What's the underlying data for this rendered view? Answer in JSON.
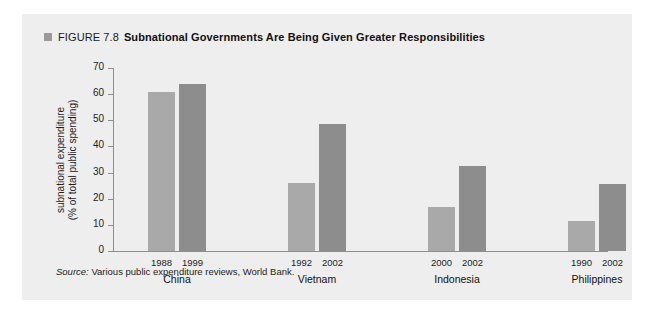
{
  "figure": {
    "bullet_icon": "square-bullet-icon",
    "number_label": "FIGURE 7.8",
    "title": "Subnational Governments Are Being Given Greater Responsibilities"
  },
  "source": {
    "label": "Source:",
    "text": " Various public expenditure reviews, World Bank."
  },
  "colors": {
    "panel_background": "#eeeeee",
    "bar_first": "#a9a9a9",
    "bar_second": "#8d8d8d",
    "axis": "#8e8e8e",
    "bullet": "#9a9a9a",
    "text": "#111111"
  },
  "chart_data": {
    "type": "bar",
    "title": "Subnational Governments Are Being Given Greater Responsibilities",
    "xlabel": "",
    "ylabel": "subnational expenditure (% of total public spending)",
    "ylabel_line1": "subnational expenditure",
    "ylabel_line2": "(% of total public spending)",
    "ylim": [
      0,
      70
    ],
    "ytick_labels": [
      "70",
      "60",
      "50",
      "40",
      "30",
      "20",
      "10",
      "0"
    ],
    "ytick_values": [
      70,
      60,
      50,
      40,
      30,
      20,
      10,
      0
    ],
    "grid": false,
    "legend": "none",
    "categories": [
      "China",
      "Vietnam",
      "Indonesia",
      "Philippines"
    ],
    "groups": [
      {
        "country": "China",
        "bars": [
          {
            "year": "1988",
            "value": 61
          },
          {
            "year": "1999",
            "value": 64
          }
        ]
      },
      {
        "country": "Vietnam",
        "bars": [
          {
            "year": "1992",
            "value": 26
          },
          {
            "year": "2002",
            "value": 48.5
          }
        ]
      },
      {
        "country": "Indonesia",
        "bars": [
          {
            "year": "2000",
            "value": 17
          },
          {
            "year": "2002",
            "value": 32.5
          }
        ]
      },
      {
        "country": "Philippines",
        "bars": [
          {
            "year": "1990",
            "value": 11.5
          },
          {
            "year": "2002",
            "value": 25.5
          }
        ]
      }
    ],
    "series": [
      {
        "name": "earlier year",
        "values": [
          61,
          26,
          17,
          11.5
        ]
      },
      {
        "name": "later year",
        "values": [
          64,
          48.5,
          32.5,
          25.5
        ]
      }
    ]
  }
}
